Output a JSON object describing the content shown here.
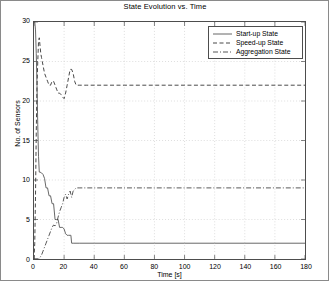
{
  "chart_data": {
    "type": "line",
    "title": "State Evolution vs. Time",
    "xlabel": "Time [s]",
    "ylabel": "No. of Sensors",
    "xlim": [
      0,
      180
    ],
    "ylim": [
      0,
      30
    ],
    "xticks": [
      0,
      20,
      40,
      60,
      80,
      100,
      120,
      140,
      160,
      180
    ],
    "yticks": [
      0,
      5,
      10,
      15,
      20,
      25,
      30
    ],
    "grid": true,
    "legend_position": "top-right",
    "series": [
      {
        "name": "Start-up State",
        "style": "solid",
        "color": "#555555",
        "x": [
          0,
          0.5,
          1,
          1.5,
          2,
          2.5,
          3,
          3.5,
          4,
          5,
          6,
          7,
          8,
          9,
          10,
          11,
          12,
          13,
          14,
          15,
          16,
          17,
          18,
          19,
          20,
          21,
          22,
          23,
          24,
          24.5,
          25,
          26,
          30,
          40,
          60,
          80,
          100,
          120,
          140,
          160,
          180
        ],
        "y": [
          30,
          30,
          29,
          26,
          22,
          17,
          13,
          11,
          11,
          10.9,
          10.7,
          10.2,
          9,
          9,
          8,
          8,
          7,
          7,
          5,
          5,
          5,
          4,
          4,
          4,
          3.8,
          3.2,
          3,
          3,
          3,
          3,
          2,
          2,
          2,
          2,
          2,
          2,
          2,
          2,
          2,
          2,
          2
        ]
      },
      {
        "name": "Speed-up State",
        "style": "dashed",
        "color": "#333333",
        "x": [
          0,
          0.5,
          1,
          1.5,
          2,
          2.5,
          3,
          3.5,
          4,
          4.5,
          5,
          5.5,
          6,
          7,
          8,
          9,
          10,
          11,
          12,
          13,
          14,
          15,
          16,
          17,
          18,
          19,
          20,
          21,
          22,
          23,
          24,
          25,
          26,
          27,
          28,
          29,
          30,
          32,
          35,
          40,
          60,
          80,
          100,
          120,
          140,
          160,
          180
        ],
        "y": [
          0,
          2,
          8,
          16,
          22,
          25,
          27.5,
          28,
          27,
          26,
          25.5,
          25,
          24.5,
          23.5,
          23,
          22.5,
          22,
          22,
          22.5,
          22.5,
          22,
          21.5,
          21,
          21,
          20.8,
          20.5,
          20.3,
          21,
          22,
          23,
          24,
          24,
          23.5,
          22.5,
          22,
          22,
          22,
          22,
          22,
          22,
          22,
          22,
          22,
          22,
          22,
          22,
          22
        ]
      },
      {
        "name": "Aggregation State",
        "style": "dashdot",
        "color": "#444444",
        "x": [
          0,
          1,
          2,
          3,
          4,
          5,
          6,
          7,
          8,
          9,
          10,
          11,
          12,
          13,
          14,
          15,
          16,
          17,
          18,
          19,
          20,
          21,
          22,
          23,
          24,
          25,
          26,
          27,
          28,
          30,
          35,
          40,
          60,
          80,
          100,
          120,
          140,
          160,
          180
        ],
        "y": [
          0,
          0,
          0,
          0,
          0.2,
          0.5,
          1,
          1.5,
          2,
          2.5,
          3,
          3.5,
          4,
          4.3,
          4.2,
          4.5,
          5.3,
          6,
          6.5,
          7,
          7.8,
          8.2,
          7.6,
          8.2,
          8.6,
          7.8,
          8.6,
          8.8,
          9,
          9,
          9,
          9,
          9,
          9,
          9,
          9,
          9,
          9,
          9
        ]
      }
    ]
  },
  "legend": {
    "items": [
      {
        "label": "Start-up State",
        "style": "solid"
      },
      {
        "label": "Speed-up State",
        "style": "dashed"
      },
      {
        "label": "Aggregation State",
        "style": "dashdot"
      }
    ]
  }
}
